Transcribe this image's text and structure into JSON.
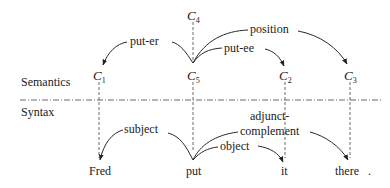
{
  "sections": {
    "semantics_label": "Semantics",
    "syntax_label": "Syntax"
  },
  "semantic_nodes": [
    {
      "id": "C4",
      "letter": "C",
      "index": "4"
    },
    {
      "id": "C1",
      "letter": "C",
      "index": "1"
    },
    {
      "id": "C5",
      "letter": "C",
      "index": "5"
    },
    {
      "id": "C2",
      "letter": "C",
      "index": "2"
    },
    {
      "id": "C3",
      "letter": "C",
      "index": "3"
    }
  ],
  "semantic_edges": [
    {
      "from": "C5",
      "to": "C1",
      "label": "put-er"
    },
    {
      "from": "C5",
      "to": "C2",
      "label": "put-ee"
    },
    {
      "from": "C5",
      "to": "C3",
      "label": "position"
    }
  ],
  "words": [
    {
      "text": "Fred"
    },
    {
      "text": "put"
    },
    {
      "text": "it"
    },
    {
      "text": "there"
    },
    {
      "text": "."
    }
  ],
  "syntax_edges": [
    {
      "from": "put",
      "to": "Fred",
      "label": "subject"
    },
    {
      "from": "put",
      "to": "it",
      "label": "object"
    },
    {
      "from": "put",
      "to": "there",
      "label_line1": "adjunct-",
      "label_line2": "complement"
    }
  ]
}
